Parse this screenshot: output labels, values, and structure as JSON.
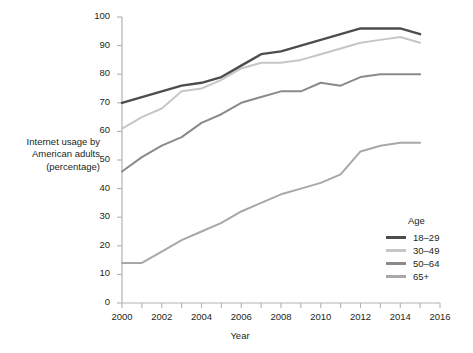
{
  "chart_data": {
    "type": "line",
    "title": "",
    "xlabel": "Year",
    "ylabel": "Internet usage by American adults (percentage)",
    "ylabel_lines": [
      "Internet usage by",
      "American adults",
      "(percentage)"
    ],
    "xlim": [
      2000,
      2016
    ],
    "ylim": [
      0,
      100
    ],
    "ytick_step": 10,
    "xtick_step": 2,
    "xminor_step": 1,
    "grid": false,
    "legend_position": "right-lower",
    "legend_title": "Age",
    "x": [
      2000,
      2001,
      2002,
      2003,
      2004,
      2005,
      2006,
      2007,
      2008,
      2009,
      2010,
      2011,
      2012,
      2013,
      2014,
      2015
    ],
    "yticks": [
      0,
      10,
      20,
      30,
      40,
      50,
      60,
      70,
      80,
      90,
      100
    ],
    "xticks": [
      2000,
      2002,
      2004,
      2006,
      2008,
      2010,
      2012,
      2014,
      2016
    ],
    "series": [
      {
        "name": "18–29",
        "color": "#4d4d4d",
        "values": [
          70,
          72,
          74,
          76,
          77,
          79,
          83,
          87,
          88,
          90,
          92,
          94,
          96,
          96,
          96,
          94
        ]
      },
      {
        "name": "30–49",
        "color": "#c6c6c6",
        "values": [
          61,
          65,
          68,
          74,
          75,
          78,
          82,
          84,
          84,
          85,
          87,
          89,
          91,
          92,
          93,
          91
        ]
      },
      {
        "name": "50–64",
        "color": "#8a8a8a",
        "values": [
          46,
          51,
          55,
          58,
          63,
          66,
          70,
          72,
          74,
          74,
          77,
          76,
          79,
          80,
          80,
          80
        ]
      },
      {
        "name": "65+",
        "color": "#a8a8a8",
        "values": [
          14,
          14,
          18,
          22,
          25,
          28,
          32,
          35,
          38,
          40,
          42,
          45,
          53,
          55,
          56,
          56
        ]
      }
    ]
  },
  "axes": {
    "y_label_lines": [
      "Internet usage by",
      "American adults",
      "(percentage)"
    ],
    "x_label": "Year",
    "y_tick_labels": [
      "0",
      "10",
      "20",
      "30",
      "40",
      "50",
      "60",
      "70",
      "80",
      "90",
      "100"
    ],
    "x_tick_labels": [
      "2000",
      "2002",
      "2004",
      "2006",
      "2008",
      "2010",
      "2012",
      "2014",
      "2016"
    ]
  },
  "legend": {
    "title": "Age",
    "items": [
      {
        "label": "18–29",
        "color": "#4d4d4d"
      },
      {
        "label": "30–49",
        "color": "#c6c6c6"
      },
      {
        "label": "50–64",
        "color": "#8a8a8a"
      },
      {
        "label": "65+",
        "color": "#a8a8a8"
      }
    ]
  },
  "colors": {
    "background": "#ffffff",
    "axis": "#b3b3b3",
    "text": "#231f20"
  }
}
